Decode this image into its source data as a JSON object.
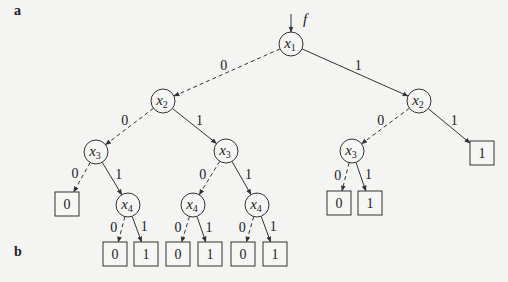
{
  "panels": {
    "a_label": "a",
    "b_label": "b"
  },
  "diagram": {
    "type": "binary-decision-tree",
    "root_label": "f",
    "nodes": [
      {
        "id": "n1",
        "var": "x",
        "sub": "1",
        "cx": 291,
        "cy": 44
      },
      {
        "id": "n2L",
        "var": "x",
        "sub": "2",
        "cx": 163,
        "cy": 101
      },
      {
        "id": "n2R",
        "var": "x",
        "sub": "2",
        "cx": 419,
        "cy": 101
      },
      {
        "id": "n3L",
        "var": "x",
        "sub": "3",
        "cx": 96,
        "cy": 152
      },
      {
        "id": "n3M",
        "var": "x",
        "sub": "3",
        "cx": 226,
        "cy": 151
      },
      {
        "id": "n3R",
        "var": "x",
        "sub": "3",
        "cx": 352,
        "cy": 151
      },
      {
        "id": "n4a",
        "var": "x",
        "sub": "4",
        "cx": 128,
        "cy": 205
      },
      {
        "id": "n4b",
        "var": "x",
        "sub": "4",
        "cx": 193,
        "cy": 205
      },
      {
        "id": "n4c",
        "var": "x",
        "sub": "4",
        "cx": 257,
        "cy": 205
      }
    ],
    "leaves": [
      {
        "id": "l3L0",
        "value": "0",
        "cx": 67,
        "cy": 204
      },
      {
        "id": "l2R1",
        "value": "1",
        "cx": 482,
        "cy": 153
      },
      {
        "id": "l3R0",
        "value": "0",
        "cx": 339,
        "cy": 203
      },
      {
        "id": "l3R1",
        "value": "1",
        "cx": 370,
        "cy": 203
      },
      {
        "id": "l4a0",
        "value": "0",
        "cx": 115,
        "cy": 254
      },
      {
        "id": "l4a1",
        "value": "1",
        "cx": 146,
        "cy": 254
      },
      {
        "id": "l4b0",
        "value": "0",
        "cx": 178,
        "cy": 254
      },
      {
        "id": "l4b1",
        "value": "1",
        "cx": 210,
        "cy": 254
      },
      {
        "id": "l4c0",
        "value": "0",
        "cx": 243,
        "cy": 254
      },
      {
        "id": "l4c1",
        "value": "1",
        "cx": 275,
        "cy": 254
      }
    ],
    "edges": [
      {
        "from": "n1",
        "to": "n2L",
        "label": "0",
        "style": "dashed"
      },
      {
        "from": "n1",
        "to": "n2R",
        "label": "1",
        "style": "solid"
      },
      {
        "from": "n2L",
        "to": "n3L",
        "label": "0",
        "style": "dashed"
      },
      {
        "from": "n2L",
        "to": "n3M",
        "label": "1",
        "style": "solid"
      },
      {
        "from": "n2R",
        "to": "n3R",
        "label": "0",
        "style": "dashed"
      },
      {
        "from": "n2R",
        "to": "l2R1",
        "label": "1",
        "style": "solid"
      },
      {
        "from": "n3L",
        "to": "l3L0",
        "label": "0",
        "style": "dashed"
      },
      {
        "from": "n3L",
        "to": "n4a",
        "label": "1",
        "style": "solid"
      },
      {
        "from": "n3M",
        "to": "n4b",
        "label": "0",
        "style": "dashed"
      },
      {
        "from": "n3M",
        "to": "n4c",
        "label": "1",
        "style": "solid"
      },
      {
        "from": "n3R",
        "to": "l3R0",
        "label": "0",
        "style": "dashed"
      },
      {
        "from": "n3R",
        "to": "l3R1",
        "label": "1",
        "style": "solid"
      },
      {
        "from": "n4a",
        "to": "l4a0",
        "label": "0",
        "style": "dashed"
      },
      {
        "from": "n4a",
        "to": "l4a1",
        "label": "1",
        "style": "solid"
      },
      {
        "from": "n4b",
        "to": "l4b0",
        "label": "0",
        "style": "dashed"
      },
      {
        "from": "n4b",
        "to": "l4b1",
        "label": "1",
        "style": "solid"
      },
      {
        "from": "n4c",
        "to": "l4c0",
        "label": "0",
        "style": "dashed"
      },
      {
        "from": "n4c",
        "to": "l4c1",
        "label": "1",
        "style": "solid"
      }
    ],
    "node_radius": 12,
    "leaf_size": 24
  }
}
